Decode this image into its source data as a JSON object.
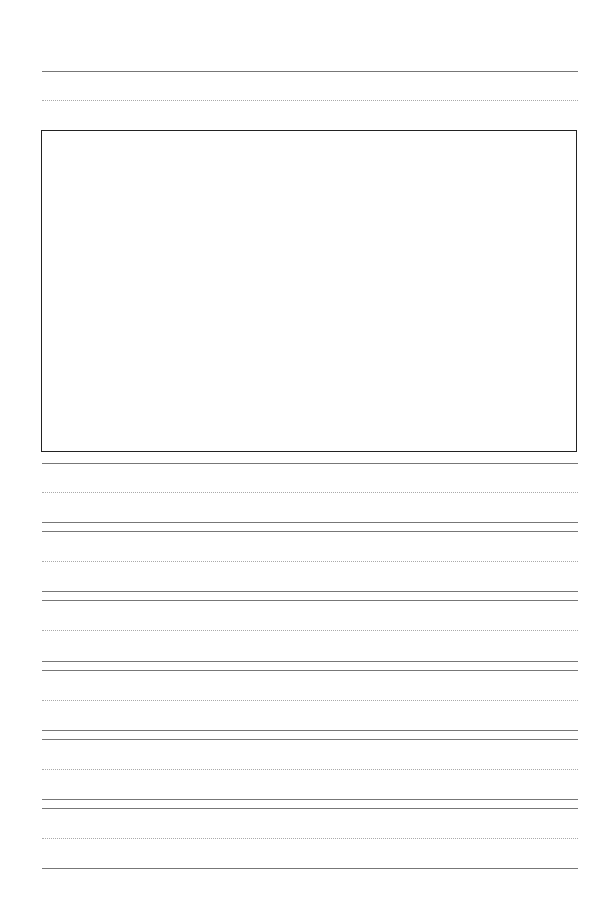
{
  "page": {
    "type": "handwriting-practice-sheet",
    "drawing_box": {
      "present": true,
      "border_color": "#222222"
    },
    "line_colors": {
      "solid": "#777777",
      "dotted": "#aaaaaa"
    },
    "solid_lines_y": [
      71,
      463,
      522,
      531,
      591,
      600,
      661,
      670,
      730,
      739,
      799,
      808,
      868
    ],
    "dotted_lines_y": [
      100,
      492,
      561,
      630,
      700,
      769,
      838
    ]
  }
}
